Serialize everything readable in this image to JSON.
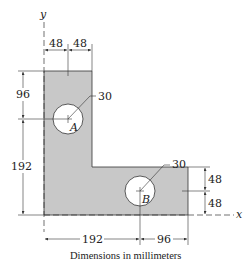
{
  "figure": {
    "caption": "Dimensions in millimeters",
    "axes": {
      "x_label": "x",
      "y_label": "y"
    },
    "shape": {
      "fill_color": "#c8c8c8",
      "stroke_color": "#333333",
      "hole_fill": "#ffffff"
    },
    "holes": [
      {
        "label": "A",
        "radius_label": "30"
      },
      {
        "label": "B",
        "radius_label": "30"
      }
    ],
    "dimensions": {
      "top_left_width": "48",
      "top_right_width": "48",
      "left_upper_height": "96",
      "left_lower_height": "192",
      "bottom_left_width": "192",
      "bottom_right_width": "96",
      "right_upper_height": "48",
      "right_lower_height": "48"
    }
  }
}
